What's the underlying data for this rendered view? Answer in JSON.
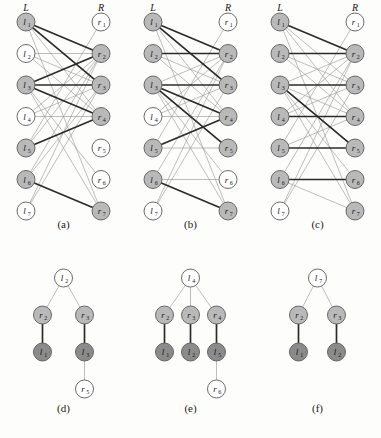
{
  "figure": {
    "title": "",
    "colors": {
      "node_white": "#ffffff",
      "node_light": "#b9b9b9",
      "node_dark": "#8b8b8b",
      "node_stroke": "#5a5a5a",
      "edge_thin": "#9a9a9a",
      "edge_thick": "#2b2b2b",
      "background": "#fdfdfb",
      "text": "#17171a"
    },
    "column_headers": {
      "left": "L",
      "right": "R"
    },
    "left_labels": [
      "l",
      "l",
      "l",
      "l",
      "l",
      "l",
      "l"
    ],
    "left_subs": [
      "1",
      "2",
      "3",
      "4",
      "5",
      "6",
      "7"
    ],
    "right_labels": [
      "r",
      "r",
      "r",
      "r",
      "r",
      "r",
      "r"
    ],
    "right_subs": [
      "1",
      "2",
      "3",
      "4",
      "5",
      "6",
      "7"
    ]
  },
  "panels": [
    {
      "id": "a",
      "caption": "(a)",
      "type": "bipartite",
      "left_shaded": [
        true,
        false,
        true,
        false,
        true,
        true,
        false
      ],
      "right_shaded": [
        false,
        true,
        true,
        true,
        false,
        false,
        true
      ],
      "edges": [
        {
          "l": 1,
          "r": 2,
          "thick": true
        },
        {
          "l": 1,
          "r": 3,
          "thick": true
        },
        {
          "l": 1,
          "r": 4,
          "thick": false
        },
        {
          "l": 1,
          "r": 7,
          "thick": false
        },
        {
          "l": 2,
          "r": 2,
          "thick": false
        },
        {
          "l": 2,
          "r": 3,
          "thick": false
        },
        {
          "l": 2,
          "r": 4,
          "thick": false
        },
        {
          "l": 3,
          "r": 2,
          "thick": true
        },
        {
          "l": 3,
          "r": 3,
          "thick": true
        },
        {
          "l": 3,
          "r": 4,
          "thick": true
        },
        {
          "l": 3,
          "r": 6,
          "thick": false
        },
        {
          "l": 3,
          "r": 7,
          "thick": false
        },
        {
          "l": 4,
          "r": 2,
          "thick": false
        },
        {
          "l": 4,
          "r": 3,
          "thick": false
        },
        {
          "l": 4,
          "r": 4,
          "thick": false
        },
        {
          "l": 5,
          "r": 2,
          "thick": false
        },
        {
          "l": 5,
          "r": 4,
          "thick": true
        },
        {
          "l": 5,
          "r": 1,
          "thick": false
        },
        {
          "l": 6,
          "r": 2,
          "thick": false
        },
        {
          "l": 6,
          "r": 3,
          "thick": false
        },
        {
          "l": 6,
          "r": 7,
          "thick": true
        },
        {
          "l": 7,
          "r": 2,
          "thick": false
        },
        {
          "l": 7,
          "r": 3,
          "thick": false
        }
      ]
    },
    {
      "id": "b",
      "caption": "(b)",
      "type": "bipartite",
      "left_shaded": [
        true,
        true,
        true,
        false,
        true,
        true,
        false
      ],
      "right_shaded": [
        false,
        true,
        true,
        true,
        true,
        false,
        true
      ],
      "edges": [
        {
          "l": 1,
          "r": 2,
          "thick": true
        },
        {
          "l": 1,
          "r": 3,
          "thick": true
        },
        {
          "l": 1,
          "r": 4,
          "thick": false
        },
        {
          "l": 1,
          "r": 7,
          "thick": false
        },
        {
          "l": 2,
          "r": 2,
          "thick": true
        },
        {
          "l": 2,
          "r": 3,
          "thick": false
        },
        {
          "l": 2,
          "r": 4,
          "thick": false
        },
        {
          "l": 3,
          "r": 2,
          "thick": false
        },
        {
          "l": 3,
          "r": 3,
          "thick": true
        },
        {
          "l": 3,
          "r": 4,
          "thick": true
        },
        {
          "l": 3,
          "r": 5,
          "thick": true
        },
        {
          "l": 3,
          "r": 6,
          "thick": false
        },
        {
          "l": 3,
          "r": 7,
          "thick": false
        },
        {
          "l": 4,
          "r": 2,
          "thick": false
        },
        {
          "l": 4,
          "r": 3,
          "thick": false
        },
        {
          "l": 4,
          "r": 4,
          "thick": false
        },
        {
          "l": 5,
          "r": 1,
          "thick": false
        },
        {
          "l": 5,
          "r": 4,
          "thick": true
        },
        {
          "l": 5,
          "r": 5,
          "thick": false
        },
        {
          "l": 6,
          "r": 2,
          "thick": false
        },
        {
          "l": 6,
          "r": 6,
          "thick": false
        },
        {
          "l": 6,
          "r": 7,
          "thick": true
        },
        {
          "l": 7,
          "r": 2,
          "thick": false
        },
        {
          "l": 7,
          "r": 3,
          "thick": false
        }
      ]
    },
    {
      "id": "c",
      "caption": "(c)",
      "type": "bipartite",
      "left_shaded": [
        true,
        true,
        true,
        true,
        true,
        true,
        false
      ],
      "right_shaded": [
        false,
        true,
        true,
        true,
        true,
        true,
        true
      ],
      "edges": [
        {
          "l": 1,
          "r": 2,
          "thick": true
        },
        {
          "l": 1,
          "r": 3,
          "thick": false
        },
        {
          "l": 1,
          "r": 4,
          "thick": false
        },
        {
          "l": 1,
          "r": 7,
          "thick": false
        },
        {
          "l": 2,
          "r": 2,
          "thick": true
        },
        {
          "l": 2,
          "r": 3,
          "thick": false
        },
        {
          "l": 2,
          "r": 4,
          "thick": false
        },
        {
          "l": 3,
          "r": 2,
          "thick": false
        },
        {
          "l": 3,
          "r": 3,
          "thick": true
        },
        {
          "l": 3,
          "r": 4,
          "thick": false
        },
        {
          "l": 3,
          "r": 5,
          "thick": true
        },
        {
          "l": 3,
          "r": 6,
          "thick": false
        },
        {
          "l": 3,
          "r": 7,
          "thick": false
        },
        {
          "l": 4,
          "r": 2,
          "thick": false
        },
        {
          "l": 4,
          "r": 3,
          "thick": false
        },
        {
          "l": 4,
          "r": 4,
          "thick": true
        },
        {
          "l": 5,
          "r": 1,
          "thick": false
        },
        {
          "l": 5,
          "r": 4,
          "thick": false
        },
        {
          "l": 5,
          "r": 5,
          "thick": true
        },
        {
          "l": 6,
          "r": 2,
          "thick": false
        },
        {
          "l": 6,
          "r": 6,
          "thick": true
        },
        {
          "l": 6,
          "r": 7,
          "thick": false
        },
        {
          "l": 7,
          "r": 2,
          "thick": false
        },
        {
          "l": 7,
          "r": 3,
          "thick": false
        }
      ]
    },
    {
      "id": "d",
      "caption": "(d)",
      "type": "tree",
      "nodes": [
        {
          "key": "root",
          "label": "l",
          "sub": "2",
          "shade": "white",
          "x": 0,
          "y": 0
        },
        {
          "key": "c1",
          "label": "r",
          "sub": "2",
          "shade": "light",
          "x": -21,
          "y": 1
        },
        {
          "key": "c2",
          "label": "r",
          "sub": "3",
          "shade": "light",
          "x": 21,
          "y": 1
        },
        {
          "key": "g1",
          "label": "l",
          "sub": "1",
          "shade": "dark",
          "x": -21,
          "y": 2
        },
        {
          "key": "g2",
          "label": "l",
          "sub": "3",
          "shade": "dark",
          "x": 21,
          "y": 2
        },
        {
          "key": "h1",
          "label": "r",
          "sub": "5",
          "shade": "white",
          "x": 21,
          "y": 3
        }
      ],
      "links": [
        {
          "from": "root",
          "to": "c1",
          "thick": false
        },
        {
          "from": "root",
          "to": "c2",
          "thick": false
        },
        {
          "from": "c1",
          "to": "g1",
          "thick": true
        },
        {
          "from": "c2",
          "to": "g2",
          "thick": true
        },
        {
          "from": "g2",
          "to": "h1",
          "thick": false
        }
      ]
    },
    {
      "id": "e",
      "caption": "(e)",
      "type": "tree",
      "nodes": [
        {
          "key": "root",
          "label": "l",
          "sub": "4",
          "shade": "white",
          "x": 0,
          "y": 0
        },
        {
          "key": "c1",
          "label": "r",
          "sub": "2",
          "shade": "light",
          "x": -26,
          "y": 1
        },
        {
          "key": "c2",
          "label": "r",
          "sub": "3",
          "shade": "light",
          "x": 0,
          "y": 1
        },
        {
          "key": "c3",
          "label": "r",
          "sub": "4",
          "shade": "light",
          "x": 26,
          "y": 1
        },
        {
          "key": "g1",
          "label": "l",
          "sub": "1",
          "shade": "dark",
          "x": -26,
          "y": 2
        },
        {
          "key": "g2",
          "label": "l",
          "sub": "2",
          "shade": "dark",
          "x": 0,
          "y": 2
        },
        {
          "key": "g3",
          "label": "l",
          "sub": "5",
          "shade": "dark",
          "x": 26,
          "y": 2
        },
        {
          "key": "h1",
          "label": "r",
          "sub": "6",
          "shade": "white",
          "x": 26,
          "y": 3
        }
      ],
      "links": [
        {
          "from": "root",
          "to": "c1",
          "thick": false
        },
        {
          "from": "root",
          "to": "c2",
          "thick": false
        },
        {
          "from": "root",
          "to": "c3",
          "thick": false
        },
        {
          "from": "c1",
          "to": "g1",
          "thick": true
        },
        {
          "from": "c2",
          "to": "g2",
          "thick": true
        },
        {
          "from": "c3",
          "to": "g3",
          "thick": true
        },
        {
          "from": "g3",
          "to": "h1",
          "thick": false
        }
      ]
    },
    {
      "id": "f",
      "caption": "(f)",
      "type": "tree",
      "nodes": [
        {
          "key": "root",
          "label": "l",
          "sub": "7",
          "shade": "white",
          "x": 0,
          "y": 0
        },
        {
          "key": "c1",
          "label": "r",
          "sub": "2",
          "shade": "light",
          "x": -19,
          "y": 1
        },
        {
          "key": "c2",
          "label": "r",
          "sub": "3",
          "shade": "light",
          "x": 19,
          "y": 1
        },
        {
          "key": "g1",
          "label": "l",
          "sub": "1",
          "shade": "dark",
          "x": -19,
          "y": 2
        },
        {
          "key": "g2",
          "label": "l",
          "sub": "2",
          "shade": "dark",
          "x": 19,
          "y": 2
        }
      ],
      "links": [
        {
          "from": "root",
          "to": "c1",
          "thick": false
        },
        {
          "from": "root",
          "to": "c2",
          "thick": false
        },
        {
          "from": "c1",
          "to": "g1",
          "thick": true
        },
        {
          "from": "c2",
          "to": "g2",
          "thick": true
        }
      ]
    }
  ]
}
